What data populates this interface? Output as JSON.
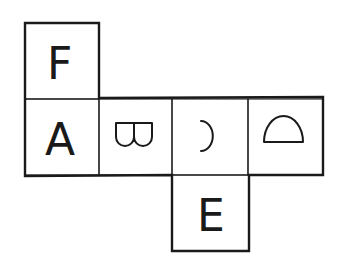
{
  "diagram": {
    "type": "cube-net",
    "faces": [
      {
        "id": "F",
        "label": "F",
        "position": "above-A",
        "rotation_deg": 0
      },
      {
        "id": "A",
        "label": "A",
        "position": "row-1",
        "rotation_deg": 0
      },
      {
        "id": "B",
        "label": "B",
        "position": "row-2",
        "rotation_deg": 90
      },
      {
        "id": "C",
        "label": "C",
        "position": "row-3",
        "rotation_deg": 180
      },
      {
        "id": "D",
        "label": "D",
        "position": "row-4",
        "rotation_deg": -90
      },
      {
        "id": "E",
        "label": "E",
        "position": "below-C",
        "rotation_deg": 0
      }
    ]
  }
}
